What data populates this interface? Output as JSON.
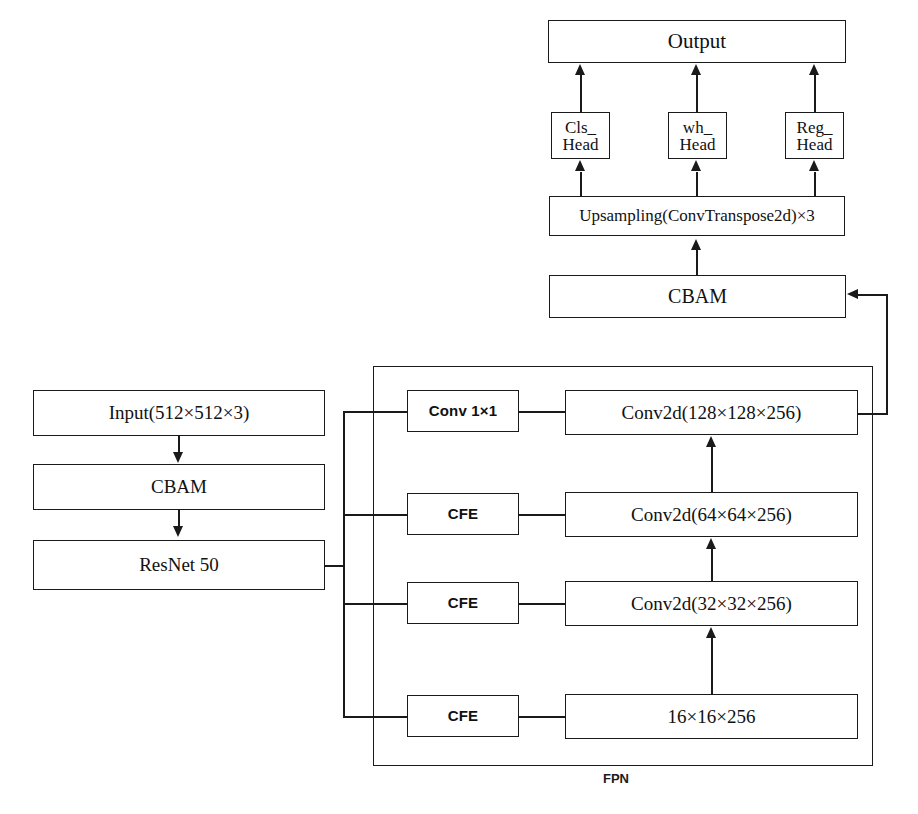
{
  "diagram": {
    "container_label": "FPN",
    "line_color": "#1a1a1a",
    "background": "#ffffff"
  },
  "backbone": {
    "input": "Input(512×512×3)",
    "cbam": "CBAM",
    "resnet": "ResNet 50"
  },
  "fpn": {
    "label": "FPN",
    "lateral": [
      {
        "op": "Conv 1×1",
        "feature": "Conv2d(128×128×256)"
      },
      {
        "op": "CFE",
        "feature": "Conv2d(64×64×256)"
      },
      {
        "op": "CFE",
        "feature": "Conv2d(32×32×256)"
      },
      {
        "op": "CFE",
        "feature": "16×16×256"
      }
    ]
  },
  "neck": {
    "cbam": "CBAM",
    "upsampling": "Upsampling(ConvTranspose2d)×3"
  },
  "heads": [
    {
      "line1": "Cls_",
      "line2": "Head"
    },
    {
      "line1": "wh_",
      "line2": "Head"
    },
    {
      "line1": "Reg_",
      "line2": "Head"
    }
  ],
  "output": {
    "label": "Output"
  }
}
